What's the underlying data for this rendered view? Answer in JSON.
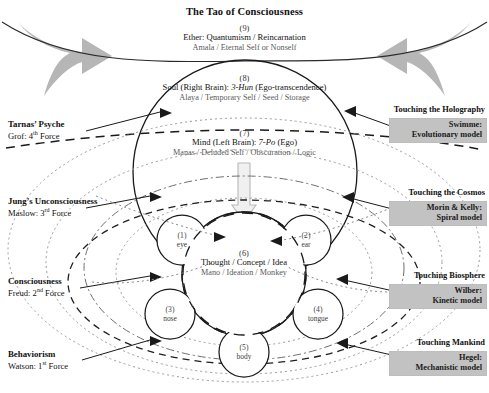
{
  "title": "The Tao of Consciousness",
  "layers": {
    "ether": {
      "number": "(9)",
      "line1": "Ether: Quantumism / Reincarnation",
      "line2": "Amala / Eternal  Self or Nonself"
    },
    "soul": {
      "number": "(8)",
      "line1_a": "Soul (Right Brain):",
      "line1_b": "3-Hun",
      "line1_c": "(Ego-transcendence)",
      "line2": "Alaya / Temporary Self / Seed / Storage"
    },
    "mind": {
      "number": "(7)",
      "line1_a": "Mind (Left Brain):",
      "line1_b": "7-Po",
      "line1_c": "(Ego)",
      "line2": "Manas / Deluded Self / Obscuration / Logic"
    },
    "thought": {
      "number": "(6)",
      "line1": "Thought / Concept / Idea",
      "line2": "Mano / Ideation / Monkey"
    }
  },
  "senses": [
    {
      "number": "(1)",
      "label": "eye"
    },
    {
      "number": "(2)",
      "label": "ear"
    },
    {
      "number": "(3)",
      "label": "nose"
    },
    {
      "number": "(4)",
      "label": "tongue"
    },
    {
      "number": "(5)",
      "label": "body"
    }
  ],
  "left_labels": [
    {
      "bold": "Tarnas’ Psyche",
      "sub_pre": "Grof: 4",
      "sub_sup": "th",
      "sub_post": " Force"
    },
    {
      "bold": "Jung’s Unconsciousness",
      "sub_pre": "Maslow: 3",
      "sub_sup": "rd",
      "sub_post": " Force"
    },
    {
      "bold": "Consciousness",
      "sub_pre": "Freud: 2",
      "sub_sup": "nd",
      "sub_post": " Force"
    },
    {
      "bold": "Behaviorism",
      "sub_pre": "Watson: 1",
      "sub_sup": "st",
      "sub_post": "  Force"
    }
  ],
  "right_labels": [
    {
      "touching": "Touching the Holography",
      "model_name": "Swimme:",
      "model_type": "Evolutionary model"
    },
    {
      "touching": "Touching the Cosmos",
      "model_name": "Morin & Kelly:",
      "model_type": "Spiral model"
    },
    {
      "touching": "Touching Biosphere",
      "model_name": "Wilber:",
      "model_type": "Kinetic model"
    },
    {
      "touching": "Touching Mankind",
      "model_name": "Hegel:",
      "model_type": "Mechanistic model"
    }
  ],
  "colors": {
    "arrow_gray": "#b3b3b3",
    "box_gray": "#c2c2c2",
    "line_dark": "#1a1a1a",
    "line_mid": "#555555",
    "line_light": "#8a8a8a"
  }
}
